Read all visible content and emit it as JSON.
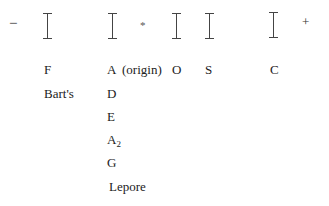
{
  "diagram": {
    "type": "electrophoresis-band-diagram",
    "polarity": {
      "negative": "−",
      "positive": "+"
    },
    "origin_marker": "*",
    "bands": [
      {
        "id": "band-1",
        "labels": [
          "F",
          "Bart's"
        ]
      },
      {
        "id": "band-2",
        "labels": [
          "A",
          "D",
          "E",
          "A2",
          "G",
          "Lepore"
        ],
        "note": "(origin)"
      },
      {
        "id": "band-3",
        "labels": [
          "O"
        ]
      },
      {
        "id": "band-4",
        "labels": [
          "S"
        ]
      },
      {
        "id": "band-5",
        "labels": [
          "C"
        ]
      }
    ],
    "labels": {
      "F": "F",
      "barts": "Bart's",
      "A": "A",
      "origin": "(origin)",
      "O": "O",
      "S": "S",
      "C": "C",
      "D": "D",
      "E": "E",
      "A2_base": "A",
      "A2_sub": "2",
      "G": "G",
      "lepore": "Lepore"
    },
    "colors": {
      "text": "#222222",
      "bar": "#444444",
      "background": "#ffffff"
    }
  }
}
